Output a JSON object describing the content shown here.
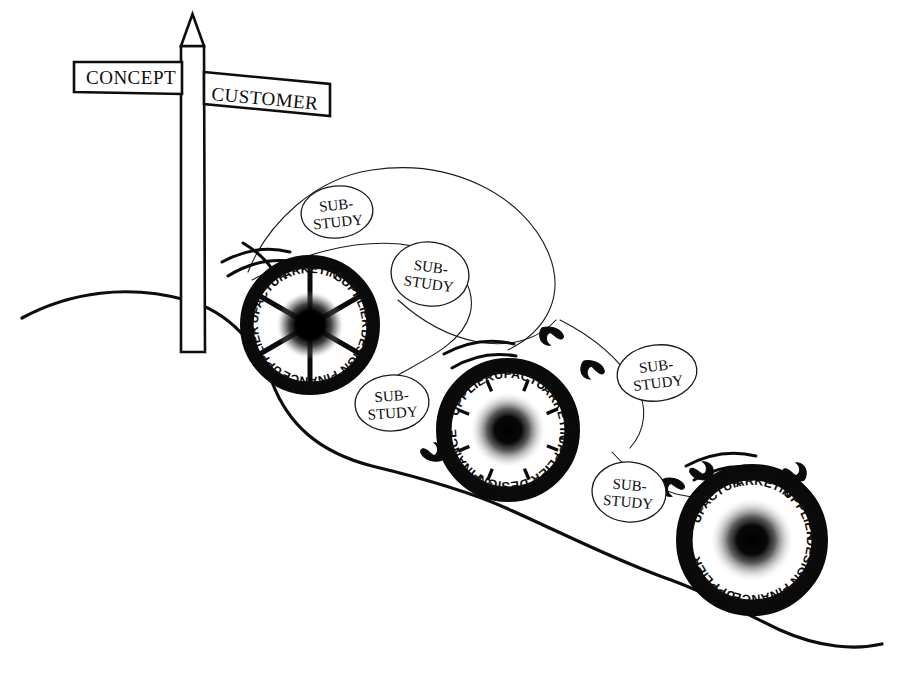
{
  "figure": {
    "background_color": "#ffffff",
    "ink_color": "#0d0d0d"
  },
  "signpost": {
    "name": "signpost",
    "arms": [
      {
        "label": "CONCEPT",
        "direction": "left"
      },
      {
        "label": "CUSTOMER",
        "direction": "right"
      }
    ]
  },
  "wheels": [
    {
      "id": "wheel-1",
      "style": "spoked",
      "cx": 310,
      "cy": 325,
      "r_outer": 70,
      "r_inner": 57,
      "hub_r": 34,
      "spoke_count": 6,
      "labels": [
        {
          "text": "MARKETING",
          "angle": -90
        },
        {
          "text": "SUPPLIER",
          "angle": -30
        },
        {
          "text": "DESIGN",
          "angle": 30
        },
        {
          "text": "FINANCE",
          "angle": 90
        },
        {
          "text": "SUPPLIERS",
          "angle": 150
        },
        {
          "text": "MANUFACTURING",
          "angle": -150
        }
      ]
    },
    {
      "id": "wheel-2",
      "style": "ticked",
      "cx": 508,
      "cy": 430,
      "r_outer": 72,
      "r_inner": 57,
      "hub_r": 38,
      "spoke_count": 8,
      "labels": [
        {
          "text": "MANUFACTURING",
          "angle": -75
        },
        {
          "text": "MARKETING",
          "angle": -20
        },
        {
          "text": "SUPPLIERS",
          "angle": 35
        },
        {
          "text": "DESIGN",
          "angle": 95
        },
        {
          "text": "FINANCE",
          "angle": 150
        },
        {
          "text": "SUPPLIERS",
          "angle": -135
        }
      ]
    },
    {
      "id": "wheel-3",
      "style": "plain",
      "cx": 752,
      "cy": 540,
      "r_outer": 76,
      "r_inner": 60,
      "hub_r": 42,
      "spoke_count": 0,
      "labels": [
        {
          "text": "MARKETING",
          "angle": -78
        },
        {
          "text": "SUPPLIERS",
          "angle": -28
        },
        {
          "text": "DESIGN",
          "angle": 22
        },
        {
          "text": "FINANCE",
          "angle": 80
        },
        {
          "text": "SUPPLIERS",
          "angle": 135
        },
        {
          "text": "MANUFACTURING",
          "angle": -135
        }
      ]
    }
  ],
  "substudies": [
    {
      "id": "substudy-1",
      "line1": "SUB-",
      "line2": "STUDY",
      "cx": 337,
      "cy": 212,
      "rx": 36,
      "ry": 26,
      "rot": -6
    },
    {
      "id": "substudy-2",
      "line1": "SUB-",
      "line2": "STUDY",
      "cx": 430,
      "cy": 274,
      "rx": 39,
      "ry": 32,
      "rot": 8
    },
    {
      "id": "substudy-3",
      "line1": "SUB-",
      "line2": "STUDY",
      "cx": 392,
      "cy": 403,
      "rx": 37,
      "ry": 28,
      "rot": -4
    },
    {
      "id": "substudy-4",
      "line1": "SUB-",
      "line2": "STUDY",
      "cx": 657,
      "cy": 373,
      "rx": 40,
      "ry": 28,
      "rot": -7
    },
    {
      "id": "substudy-5",
      "line1": "SUB-",
      "line2": "STUDY",
      "cx": 629,
      "cy": 492,
      "rx": 37,
      "ry": 30,
      "rot": 5
    }
  ],
  "road": {
    "name": "winding-road-line",
    "path": "M 22 318 C 70 292 128 284 186 300 C 232 312 258 348 272 382 C 288 424 318 452 372 466 C 430 480 470 492 506 508 C 560 532 606 556 660 576 C 706 592 742 612 780 630 C 820 648 856 650 882 644"
  },
  "thread": {
    "name": "sub-study-thread",
    "segments": [
      "M 248 272 C 268 222 316 178 372 170 C 452 158 524 196 548 252 C 566 294 548 330 508 350",
      "M 252 280 C 300 254 352 240 400 244 C 452 250 478 284 470 314 C 462 344 424 360 396 376",
      "M 398 300 C 420 320 446 336 478 342 C 512 348 540 338 556 320",
      "M 560 320 C 596 338 620 360 636 386 C 648 406 646 430 630 448",
      "M 612 452 C 628 470 650 486 676 494 C 700 500 720 496 734 486"
    ]
  },
  "motion_marks": [
    {
      "id": "motion-wheel-1",
      "paths": [
        "M 222 262 C 244 250 266 246 290 252",
        "M 228 276 C 250 262 272 258 296 262",
        "M 243 243 C 258 252 268 262 274 272"
      ]
    },
    {
      "id": "motion-wheel-2",
      "paths": [
        "M 444 354 C 466 342 490 338 514 344",
        "M 452 368 C 472 356 494 352 516 356"
      ]
    },
    {
      "id": "motion-wheel-3",
      "paths": [
        "M 686 466 C 708 454 732 450 756 456",
        "M 694 480 C 714 468 736 464 758 468"
      ]
    }
  ],
  "hooks": [
    {
      "id": "hook-1",
      "cx": 551,
      "cy": 336,
      "rot": 18
    },
    {
      "id": "hook-2",
      "cx": 592,
      "cy": 370,
      "rot": 24
    },
    {
      "id": "hook-3",
      "cx": 433,
      "cy": 452,
      "rot": 200
    },
    {
      "id": "hook-4",
      "cx": 672,
      "cy": 487,
      "rot": 14
    },
    {
      "id": "hook-5",
      "cx": 795,
      "cy": 472,
      "rot": 200
    },
    {
      "id": "hook-6",
      "cx": 702,
      "cy": 471,
      "rot": 196
    }
  ]
}
